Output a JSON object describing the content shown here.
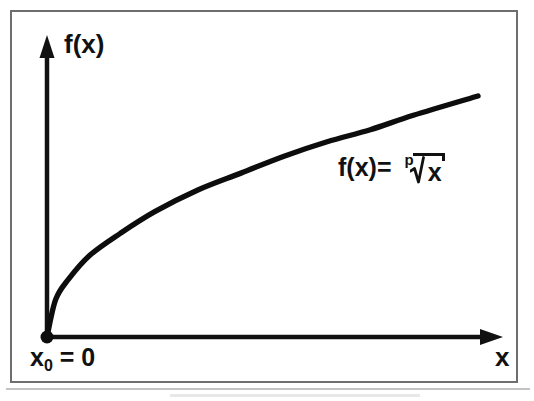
{
  "figure": {
    "background_color": "#ffffff",
    "frame_color": "#6e6e6e",
    "ink_color": "#111111",
    "axis_labels": {
      "y": "f(x)",
      "x": "x"
    },
    "origin_label": {
      "base": "x",
      "subscript": "0",
      "equals": " = 0",
      "full": "x0 = 0"
    },
    "formula": {
      "lhs": "f(x)=",
      "radical_index": "p",
      "radicand": "x",
      "full": "f(x) = p-th root of x"
    }
  },
  "chart_data": {
    "type": "line",
    "title": "",
    "xlabel": "x",
    "ylabel": "f(x)",
    "legend": [],
    "annotations": [
      {
        "text": "f(x)= p√x",
        "x": 0.68,
        "y": 0.72
      },
      {
        "text": "x0 = 0",
        "x": 0.0,
        "y": 0.0
      }
    ],
    "grid": false,
    "axis_style": "arrow-headed half-axes through origin",
    "xlim": [
      0,
      1
    ],
    "ylim": [
      0,
      1
    ],
    "xticks": [],
    "yticks": [],
    "series": [
      {
        "name": "f(x) = p-th root of x",
        "equation": "y = x^(1/p)",
        "exponent_p": 2.2,
        "marker_at_origin": true,
        "x": [
          0,
          0.02,
          0.05,
          0.1,
          0.17,
          0.25,
          0.35,
          0.45,
          0.55,
          0.65,
          0.75,
          0.85,
          1.0
        ],
        "y": [
          0,
          0.155,
          0.24,
          0.34,
          0.43,
          0.52,
          0.61,
          0.68,
          0.75,
          0.81,
          0.86,
          0.92,
          1.0
        ]
      }
    ]
  }
}
